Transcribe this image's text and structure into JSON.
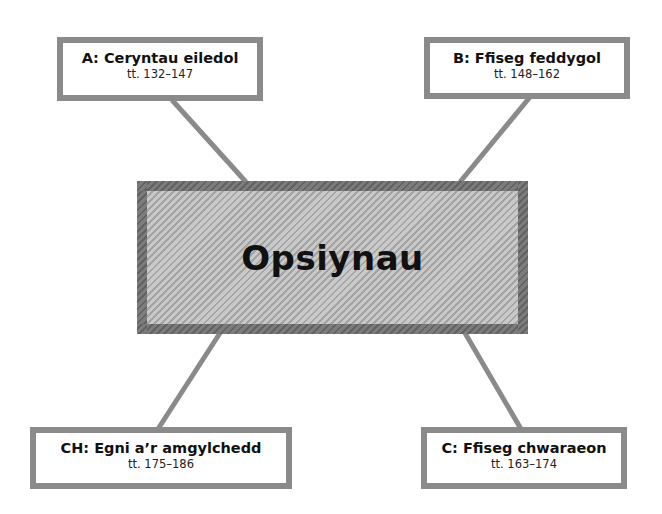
{
  "diagram": {
    "center": {
      "label": "Opsiynau"
    },
    "options": [
      {
        "id": "A",
        "title": "A: Ceryntau eiledol",
        "pages": "tt. 132–147"
      },
      {
        "id": "B",
        "title": "B: Ffiseg feddygol",
        "pages": "tt. 148–162"
      },
      {
        "id": "CH",
        "title": "CH: Egni a’r amgylchedd",
        "pages": "tt. 175–186"
      },
      {
        "id": "C",
        "title": "C: Ffiseg chwaraeon",
        "pages": "tt. 163–174"
      }
    ],
    "colors": {
      "box_border": "#8a8a8a",
      "center_border": "#6e6e6e",
      "center_fill_light": "#c9c9c9",
      "center_fill_dark": "#a4a4a4",
      "connector": "#8a8a8a",
      "text": "#111111"
    }
  }
}
